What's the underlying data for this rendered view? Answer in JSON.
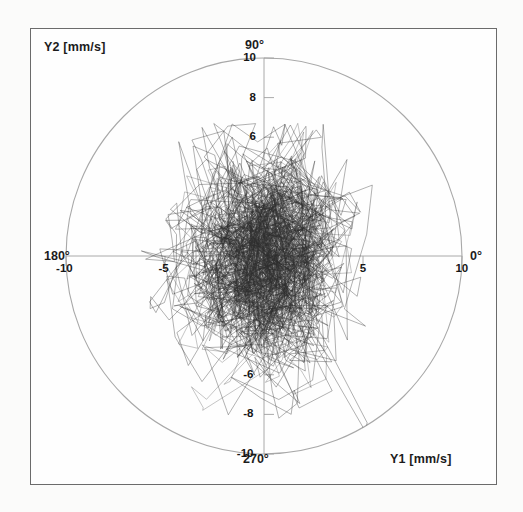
{
  "figure": {
    "background_color": "#fbfbfa",
    "frame_color": "#6b6b6b",
    "axis_color": "#9a9a9a",
    "trace_color": "#2b2b2b",
    "circle_color": "#a8a8a8"
  },
  "labels": {
    "y2_axis": "Y2 [mm/s]",
    "y1_axis": "Y1 [mm/s]"
  },
  "angles": {
    "deg_90": "90°",
    "deg_270": "270°",
    "deg_180": "180°",
    "deg_0": "0°"
  },
  "ticks": {
    "vertical": [
      {
        "label": "10",
        "value": 10
      },
      {
        "label": "8",
        "value": 8
      },
      {
        "label": "6",
        "value": 6
      },
      {
        "label": "-6",
        "value": -6
      },
      {
        "label": "-8",
        "value": -8
      },
      {
        "label": "-10",
        "value": -10
      }
    ],
    "horizontal": [
      {
        "label": "-10",
        "value": -10
      },
      {
        "label": "-5",
        "value": -5
      },
      {
        "label": "5",
        "value": 5
      },
      {
        "label": "10",
        "value": 10
      }
    ]
  },
  "chart_data": {
    "type": "scatter",
    "plot_style": "polar-scatter-trajectory",
    "title": "",
    "subtitle": "",
    "xlabel": "Y1 [mm/s]",
    "ylabel": "Y2 [mm/s]",
    "xlim": [
      -10.8,
      10.8
    ],
    "ylim": [
      -10.8,
      10.8
    ],
    "radial_max": 10,
    "radial_unit": "mm/s",
    "grid": false,
    "legend": null,
    "angular_tick_labels": [
      "0°",
      "90°",
      "180°",
      "270°"
    ],
    "radial_tick_labels_vertical": [
      "10",
      "8",
      "6",
      "-6",
      "-8",
      "-10"
    ],
    "radial_tick_labels_horizontal": [
      "-10",
      "-5",
      "5",
      "10"
    ],
    "series": [
      {
        "name": "velocity trajectory",
        "description": "continuous connected 2D velocity trace (Y1 vs Y2), dense random-walk scribble concentrated near origin, vertically elongated",
        "center": [
          -0.3,
          0.2
        ],
        "std_x": 2.1,
        "std_y": 2.8,
        "extent_x": [
          -6.2,
          5.6
        ],
        "extent_y": [
          -9.0,
          6.8
        ],
        "n_points": 2400,
        "line_width": 0.45,
        "color": "#2b2b2b"
      }
    ]
  }
}
